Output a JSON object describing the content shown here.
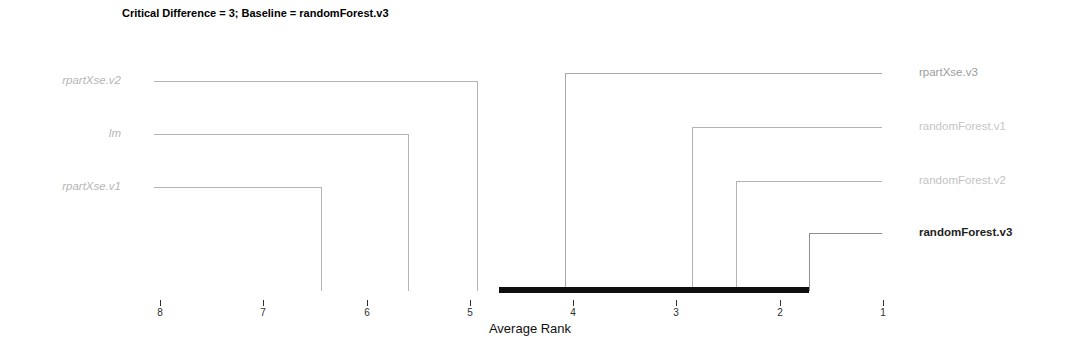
{
  "chart_data": {
    "type": "cd-diagram",
    "title": "Critical Difference = 3; Baseline = randomForest.v3",
    "xlabel": "Average Rank",
    "critical_difference": 3,
    "baseline_model": "randomForest.v3",
    "cd_interval": [
      1.72,
      4.72
    ],
    "axis": {
      "ticks": [
        8,
        7,
        6,
        5,
        4,
        3,
        2,
        1
      ],
      "min": 1,
      "max": 8,
      "direction": "reversed"
    },
    "models": [
      {
        "name": "randomForest.v3",
        "avg_rank": 1.72,
        "side": "right",
        "row": 3,
        "baseline": true,
        "significantly_different_from_baseline": false,
        "italic": false,
        "bold": true,
        "label_color": "#1e1e1e",
        "line_color": "#8f8f8f"
      },
      {
        "name": "randomForest.v2",
        "avg_rank": 2.42,
        "side": "right",
        "row": 2,
        "baseline": false,
        "significantly_different_from_baseline": false,
        "italic": false,
        "bold": false,
        "label_color": "#c3c3c3",
        "line_color": "#b4b4b4"
      },
      {
        "name": "randomForest.v1",
        "avg_rank": 2.85,
        "side": "right",
        "row": 1,
        "baseline": false,
        "significantly_different_from_baseline": false,
        "italic": false,
        "bold": false,
        "label_color": "#c6c6c6",
        "line_color": "#b4b4b4"
      },
      {
        "name": "rpartXse.v3",
        "avg_rank": 4.08,
        "side": "right",
        "row": 0,
        "baseline": false,
        "significantly_different_from_baseline": false,
        "italic": false,
        "bold": false,
        "label_color": "#9c9c9c",
        "line_color": "#a8a8a8"
      },
      {
        "name": "rpartXse.v2",
        "avg_rank": 4.93,
        "side": "left",
        "row": 0,
        "baseline": false,
        "significantly_different_from_baseline": true,
        "italic": true,
        "bold": false,
        "label_color": "#b6b6b6",
        "line_color": "#b4b4b4"
      },
      {
        "name": "lm",
        "avg_rank": 5.6,
        "side": "left",
        "row": 1,
        "baseline": false,
        "significantly_different_from_baseline": true,
        "italic": true,
        "bold": false,
        "label_color": "#b6b6b6",
        "line_color": "#b4b4b4"
      },
      {
        "name": "rpartXse.v1",
        "avg_rank": 6.44,
        "side": "left",
        "row": 2,
        "baseline": false,
        "significantly_different_from_baseline": true,
        "italic": true,
        "bold": false,
        "label_color": "#b6b6b6",
        "line_color": "#b4b4b4"
      }
    ],
    "colors": {
      "cd_bar": "#0e0e0e",
      "axis_text": "#2e2e2e",
      "title": "#000000",
      "background": "#ffffff"
    }
  }
}
